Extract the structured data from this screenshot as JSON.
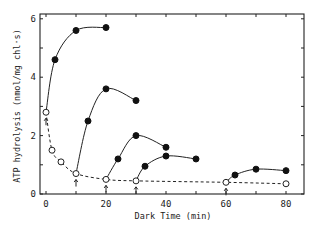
{
  "chart_data": {
    "type": "line",
    "title": "",
    "xlabel": "Dark Time (min)",
    "ylabel": "ATP hydrolysis (nmol/mg chl·s)",
    "xlim": [
      -2,
      86
    ],
    "ylim": [
      0,
      6.3
    ],
    "x_ticks": [
      0,
      20,
      40,
      60,
      80
    ],
    "x_tick_labels": [
      "0",
      "20",
      "40",
      "60",
      "80"
    ],
    "y_ticks": [
      0,
      2,
      4,
      6
    ],
    "y_tick_labels": [
      "0",
      "2",
      "4",
      "6"
    ],
    "grid": false,
    "legend": null,
    "arrow_markers_at_x": [
      0,
      10,
      20,
      30,
      60
    ],
    "series": [
      {
        "name": "dark decay (open circles)",
        "marker": "open-circle",
        "line": "dashed",
        "x": [
          0,
          2,
          5,
          10,
          20,
          30,
          60,
          80
        ],
        "y": [
          2.8,
          1.5,
          1.1,
          0.7,
          0.5,
          0.45,
          0.4,
          0.35
        ]
      },
      {
        "name": "activation from 0 min",
        "marker": "filled-circle",
        "line": "solid",
        "x": [
          0,
          3,
          10,
          20
        ],
        "y": [
          2.8,
          4.6,
          5.6,
          5.7
        ]
      },
      {
        "name": "activation from 10 min",
        "marker": "filled-circle",
        "line": "solid",
        "x": [
          10,
          14,
          20,
          30
        ],
        "y": [
          0.7,
          2.5,
          3.6,
          3.2
        ]
      },
      {
        "name": "activation from 20 min",
        "marker": "filled-circle",
        "line": "solid",
        "x": [
          20,
          24,
          30,
          40
        ],
        "y": [
          0.5,
          1.2,
          2.0,
          1.6
        ]
      },
      {
        "name": "activation from 30 min",
        "marker": "filled-circle",
        "line": "solid",
        "x": [
          30,
          33,
          40,
          50
        ],
        "y": [
          0.45,
          0.95,
          1.3,
          1.2
        ]
      },
      {
        "name": "activation from 60 min",
        "marker": "filled-circle",
        "line": "solid",
        "x": [
          60,
          63,
          70,
          80
        ],
        "y": [
          0.4,
          0.65,
          0.85,
          0.8
        ]
      }
    ]
  },
  "labels": {
    "xlabel": "Dark Time  (min)",
    "ylabel": "ATP hydrolysis  (nmol/mg chl·s)"
  }
}
